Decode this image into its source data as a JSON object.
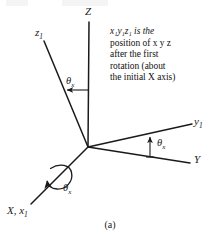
{
  "figure": {
    "label": "(a)",
    "caption_lines": [
      "x₁y₁z₁ is the",
      "position of x y z",
      "after the first",
      "rotation (about",
      "the initial X axis)"
    ],
    "caption_text": "x1y1z1 is the position of xyz after the first rotation (about the initial X axis)",
    "colors": {
      "line": "#1a1a1a",
      "text": "#1a1a1a",
      "background": "#ffffff"
    },
    "origin": {
      "x": 88,
      "y": 147
    },
    "axes": [
      {
        "name": "Z",
        "label": "Z",
        "label_sub": "",
        "from": {
          "x": 88,
          "y": 147
        },
        "to": {
          "x": 89,
          "y": 22
        },
        "label_pos": {
          "x": 85,
          "y": 6
        }
      },
      {
        "name": "z1",
        "label": "z",
        "label_sub": "1",
        "from": {
          "x": 88,
          "y": 147
        },
        "to": {
          "x": 44,
          "y": 41
        },
        "label_pos": {
          "x": 35,
          "y": 27
        }
      },
      {
        "name": "y1",
        "label": "y",
        "label_sub": "1",
        "from": {
          "x": 88,
          "y": 147
        },
        "to": {
          "x": 192,
          "y": 124
        },
        "label_pos": {
          "x": 194,
          "y": 117
        }
      },
      {
        "name": "Y",
        "label": "Y",
        "label_sub": "",
        "from": {
          "x": 88,
          "y": 147
        },
        "to": {
          "x": 190,
          "y": 163
        },
        "label_pos": {
          "x": 194,
          "y": 155
        }
      },
      {
        "name": "X-x1",
        "label": "X, x",
        "label_sub": "1",
        "from": {
          "x": 88,
          "y": 147
        },
        "to": {
          "x": 31,
          "y": 204
        },
        "label_pos": {
          "x": 8,
          "y": 206
        }
      }
    ],
    "angle_labels": [
      {
        "name": "theta-x-top",
        "symbol": "θ",
        "subscript": "x",
        "pos": {
          "x": 66,
          "y": 77
        }
      },
      {
        "name": "theta-x-right",
        "symbol": "θ",
        "subscript": "x",
        "pos": {
          "x": 155,
          "y": 139
        }
      },
      {
        "name": "theta-x-rotation",
        "symbol": "θ",
        "subscript": "x",
        "pos": {
          "x": 63,
          "y": 184
        }
      }
    ],
    "arrows": [
      {
        "name": "theta-x-top-arrow",
        "description": "horizontal arrow from Z axis pointing left toward z1 axis",
        "from": {
          "x": 89,
          "y": 90
        },
        "to": {
          "x": 66,
          "y": 90
        }
      },
      {
        "name": "theta-x-right-arrow",
        "description": "vertical arrow from Y axis pointing up toward y1 axis",
        "from": {
          "x": 150,
          "y": 157
        },
        "to": {
          "x": 150,
          "y": 136
        }
      },
      {
        "name": "rotation-arc-arrow",
        "description": "circular rotation arc about the X axis with arrowhead"
      }
    ]
  }
}
